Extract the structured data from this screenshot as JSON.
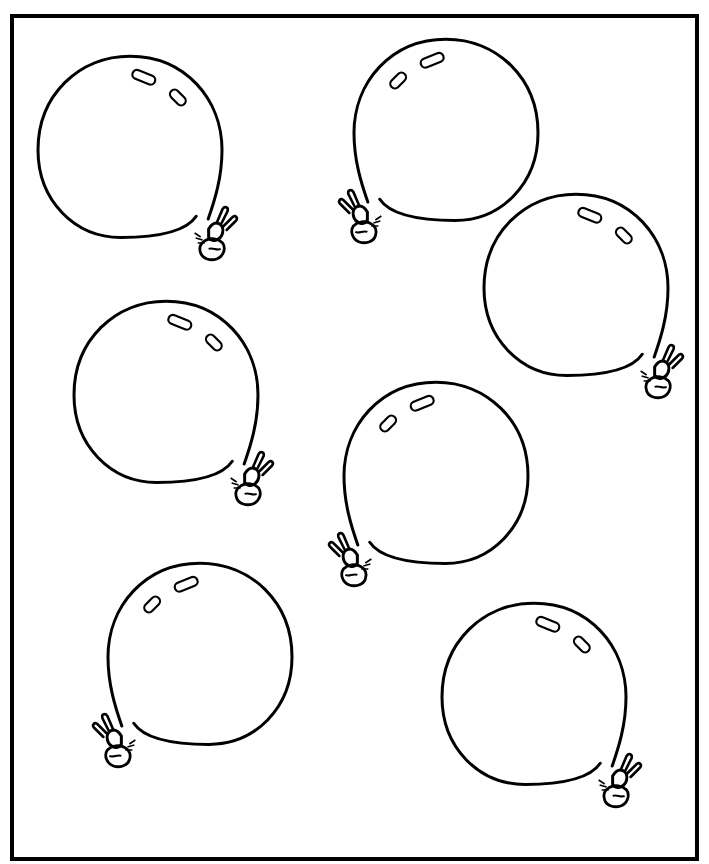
{
  "page": {
    "background_color": "#ffffff",
    "line_color": "#000000",
    "balloon_count": 7
  },
  "balloons": [
    {
      "id": "balloon-1",
      "knot_side": "bottom-right"
    },
    {
      "id": "balloon-2",
      "knot_side": "bottom-left"
    },
    {
      "id": "balloon-3",
      "knot_side": "bottom-right"
    },
    {
      "id": "balloon-4",
      "knot_side": "bottom-right"
    },
    {
      "id": "balloon-5",
      "knot_side": "bottom-left"
    },
    {
      "id": "balloon-6",
      "knot_side": "bottom-left"
    },
    {
      "id": "balloon-7",
      "knot_side": "bottom-right"
    }
  ]
}
